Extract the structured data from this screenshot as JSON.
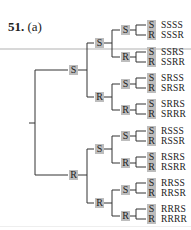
{
  "problem": {
    "number": "51.",
    "part": "(a)"
  },
  "tree": {
    "level1": [
      "S",
      "R"
    ],
    "level2": [
      "S",
      "R",
      "S",
      "R"
    ],
    "level3": [
      "S",
      "R",
      "S",
      "R",
      "S",
      "R",
      "S",
      "R"
    ],
    "level4": [
      "S",
      "R",
      "S",
      "R",
      "S",
      "R",
      "S",
      "R",
      "S",
      "R",
      "S",
      "R",
      "S",
      "R",
      "S",
      "R"
    ],
    "outcomes": [
      "SSSS",
      "SSSR",
      "SSRS",
      "SSRR",
      "SRSS",
      "SRSR",
      "SRRS",
      "SRRR",
      "RSSS",
      "RSSR",
      "RSRS",
      "RSRR",
      "RRSS",
      "RRSR",
      "RRRS",
      "RRRR"
    ]
  },
  "colors": {
    "node_fill": "#bdbdbd",
    "line": "#333333"
  }
}
